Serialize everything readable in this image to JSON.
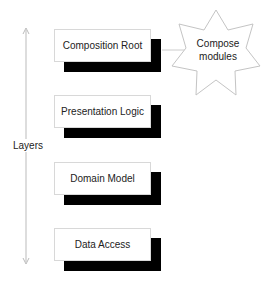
{
  "diagram": {
    "axis": {
      "label": "Layers",
      "direction": "bidirectional-vertical"
    },
    "layers": [
      {
        "label": "Composition Root"
      },
      {
        "label": "Presentation Logic"
      },
      {
        "label": "Domain Model"
      },
      {
        "label": "Data Access"
      }
    ],
    "callout": {
      "label_line1": "Compose",
      "label_line2": "modules",
      "shape": "star",
      "attached_to": "Composition Root"
    },
    "colors": {
      "box_border": "#d8d8d8",
      "shadow": "#000000",
      "line": "#bbbbbb"
    }
  }
}
